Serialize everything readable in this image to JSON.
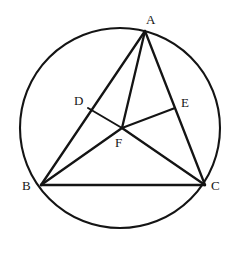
{
  "figure": {
    "background_color": "#ffffff",
    "stroke_color": "#141414",
    "width": 238,
    "height": 253
  },
  "chart_data": {
    "type": "diagram",
    "subtype": "euclidean-geometry",
    "coordinate_system": "pixels, origin top-left",
    "circle": {
      "name": "circumcircle",
      "cx": 120,
      "cy": 128,
      "r": 100
    },
    "points": [
      {
        "id": "A",
        "label": "A",
        "x": 145,
        "y": 31,
        "label_x": 146,
        "label_y": 13,
        "on": "circle"
      },
      {
        "id": "B",
        "label": "B",
        "x": 41,
        "y": 185,
        "label_x": 22,
        "label_y": 179,
        "on": "circle"
      },
      {
        "id": "C",
        "label": "C",
        "x": 205,
        "y": 185,
        "label_x": 211,
        "label_y": 179,
        "on": "circle"
      },
      {
        "id": "D",
        "label": "D",
        "x": 88,
        "y": 108,
        "label_x": 74,
        "label_y": 94,
        "on": "segment AB"
      },
      {
        "id": "E",
        "label": "E",
        "x": 175,
        "y": 108,
        "label_x": 181,
        "label_y": 96,
        "on": "segment AC"
      },
      {
        "id": "F",
        "label": "F",
        "x": 122,
        "y": 128,
        "label_x": 115,
        "label_y": 136,
        "on": "interior intersection"
      }
    ],
    "segments": [
      {
        "id": "AB",
        "from": "A",
        "to": "B",
        "note": "triangle side, passes through D"
      },
      {
        "id": "AC",
        "from": "A",
        "to": "C",
        "note": "triangle side, passes through E"
      },
      {
        "id": "BC",
        "from": "B",
        "to": "C",
        "note": "triangle base"
      },
      {
        "id": "AF",
        "from": "A",
        "to": "F",
        "note": "cevian from A to F"
      },
      {
        "id": "BF",
        "from": "B",
        "to": "F",
        "note": "cevian from B to F"
      },
      {
        "id": "CF",
        "from": "C",
        "to": "F",
        "note": "cevian from C to F"
      },
      {
        "id": "DF",
        "from": "D",
        "to": "F",
        "note": "segment from D to F"
      },
      {
        "id": "EF",
        "from": "E",
        "to": "F",
        "note": "segment from E to F"
      }
    ],
    "labels": [
      "A",
      "B",
      "C",
      "D",
      "E",
      "F"
    ],
    "legend": [],
    "grid": false
  }
}
